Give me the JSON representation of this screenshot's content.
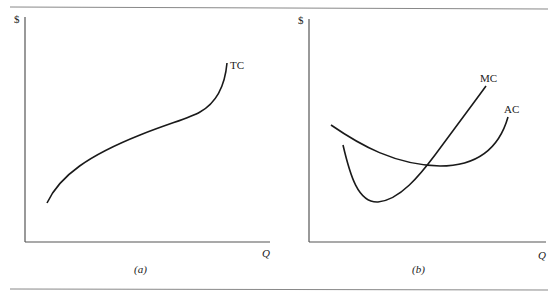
{
  "figure": {
    "panels": [
      {
        "id": "a",
        "caption": "(a)",
        "y_axis_label": "$",
        "x_axis_label": "Q",
        "curves": [
          {
            "name": "TC",
            "label": "TC",
            "shape": "cubic total cost: concave then convex, rising"
          }
        ]
      },
      {
        "id": "b",
        "caption": "(b)",
        "y_axis_label": "$",
        "x_axis_label": "Q",
        "curves": [
          {
            "name": "MC",
            "label": "MC",
            "shape": "U-shaped marginal cost, minimum left of AC minimum"
          },
          {
            "name": "AC",
            "label": "AC",
            "shape": "U-shaped average cost, MC crosses at AC minimum"
          }
        ]
      }
    ],
    "colors": {
      "line": "#1a1a1a",
      "axis": "#555555",
      "rule": "#888888"
    }
  }
}
